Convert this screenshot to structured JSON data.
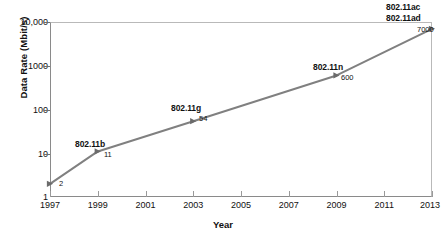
{
  "chart_data": {
    "type": "line",
    "title": "",
    "xlabel": "Year",
    "ylabel": "Data Rate (Mbit/s)",
    "yscale": "log",
    "ylim": [
      1,
      10000
    ],
    "xlim": [
      1997,
      2013
    ],
    "grid": false,
    "legend": "none",
    "line_color": "#808080",
    "marker_color": "#6b6b6b",
    "x": [
      1997,
      1999,
      2003,
      2009,
      2013
    ],
    "values": [
      2,
      11,
      54,
      600,
      7000
    ],
    "y_ticks": [
      "10,000",
      "1000",
      "100",
      "10",
      "1"
    ],
    "y_tick_values": [
      10000,
      1000,
      100,
      10,
      1
    ],
    "x_ticks": [
      "1997",
      "1999",
      "2001",
      "2003",
      "2005",
      "2007",
      "2009",
      "2011",
      "2013"
    ],
    "x_tick_values": [
      1997,
      1999,
      2001,
      2003,
      2005,
      2007,
      2009,
      2011,
      2013
    ],
    "points": [
      {
        "x": 1997,
        "y": 2,
        "value_label": "2",
        "name_label": ""
      },
      {
        "x": 1999,
        "y": 11,
        "value_label": "11",
        "name_label": "802.11b"
      },
      {
        "x": 2003,
        "y": 54,
        "value_label": "54",
        "name_label": "802.11g"
      },
      {
        "x": 2009,
        "y": 600,
        "value_label": "600",
        "name_label": "802.11n"
      },
      {
        "x": 2013,
        "y": 7000,
        "value_label": "7000",
        "name_label": "802.11ac"
      }
    ],
    "annotations": [
      {
        "text": "802.11b",
        "for_point": 1999
      },
      {
        "text": "802.11g",
        "for_point": 2003
      },
      {
        "text": "802.11n",
        "for_point": 2009
      },
      {
        "text": "802.11ac",
        "for_point": 2013
      },
      {
        "text": "802.11ad",
        "for_point": 2013
      }
    ]
  },
  "labels": {
    "y_title": "Data Rate (Mbit/s)",
    "x_title": "Year",
    "y0": "10,000",
    "y1": "1000",
    "y2": "100",
    "y3": "10",
    "y4": "1",
    "x0": "1997",
    "x1": "1999",
    "x2": "2001",
    "x3": "2003",
    "x4": "2005",
    "x5": "2007",
    "x6": "2009",
    "x7": "2011",
    "x8": "2013",
    "ann_b": "802.11b",
    "ann_g": "802.11g",
    "ann_n": "802.11n",
    "ann_ac": "802.11ac",
    "ann_ad": "802.11ad",
    "val_2": "2",
    "val_11": "11",
    "val_54": "54",
    "val_600": "600",
    "val_7000": "7000"
  }
}
